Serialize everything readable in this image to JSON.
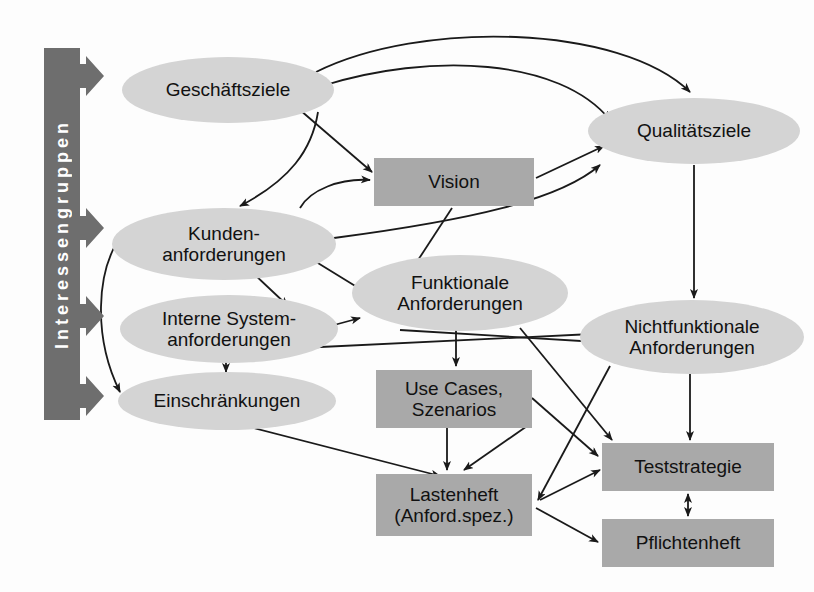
{
  "diagram": {
    "stakeholder_bar": {
      "label": "Interessengruppen",
      "color": "#6e6e6e",
      "arrow_count": 4
    },
    "colors": {
      "ellipse_fill": "#d4d4d4",
      "rect_fill": "#a9a9a9",
      "bar_fill": "#6e6e6e",
      "edge_stroke": "#1a1a1a",
      "text": "#111111",
      "background": "#fdfdfd"
    },
    "nodes": [
      {
        "id": "geschaeftsziele",
        "shape": "ellipse",
        "lines": [
          "Geschäftsziele"
        ],
        "x": 122,
        "y": 57,
        "w": 212,
        "h": 66
      },
      {
        "id": "qualitaetsziele",
        "shape": "ellipse",
        "lines": [
          "Qualitätsziele"
        ],
        "x": 588,
        "y": 98,
        "w": 212,
        "h": 66
      },
      {
        "id": "vision",
        "shape": "rect",
        "lines": [
          "Vision"
        ],
        "x": 374,
        "y": 158,
        "w": 160,
        "h": 48
      },
      {
        "id": "kundenanforderungen",
        "shape": "ellipse",
        "lines": [
          "Kunden-",
          "anforderungen"
        ],
        "x": 112,
        "y": 208,
        "w": 224,
        "h": 72
      },
      {
        "id": "funktionale",
        "shape": "ellipse",
        "lines": [
          "Funktionale",
          "Anforderungen"
        ],
        "x": 352,
        "y": 255,
        "w": 216,
        "h": 76
      },
      {
        "id": "interne_system",
        "shape": "ellipse",
        "lines": [
          "Interne System-",
          "anforderungen"
        ],
        "x": 120,
        "y": 295,
        "w": 218,
        "h": 68
      },
      {
        "id": "nichtfunktionale",
        "shape": "ellipse",
        "lines": [
          "Nichtfunktionale",
          "Anforderungen"
        ],
        "x": 580,
        "y": 300,
        "w": 224,
        "h": 74
      },
      {
        "id": "einschraenkungen",
        "shape": "ellipse",
        "lines": [
          "Einschränkungen"
        ],
        "x": 118,
        "y": 372,
        "w": 218,
        "h": 58
      },
      {
        "id": "use_cases",
        "shape": "rect",
        "lines": [
          "Use Cases,",
          "Szenarios"
        ],
        "x": 376,
        "y": 370,
        "w": 156,
        "h": 58
      },
      {
        "id": "lastenheft",
        "shape": "rect",
        "lines": [
          "Lastenheft",
          "(Anford.spez.)"
        ],
        "x": 376,
        "y": 474,
        "w": 156,
        "h": 62
      },
      {
        "id": "teststrategie",
        "shape": "rect",
        "lines": [
          "Teststrategie"
        ],
        "x": 602,
        "y": 443,
        "w": 172,
        "h": 48
      },
      {
        "id": "pflichtenheft",
        "shape": "rect",
        "lines": [
          "Pflichtenheft"
        ],
        "x": 602,
        "y": 519,
        "w": 172,
        "h": 48
      }
    ],
    "edges": [
      {
        "from": "geschaeftsziele",
        "to": "qualitaetsziele",
        "style": "curved"
      },
      {
        "from": "geschaeftsziele",
        "to": "vision",
        "style": "straight"
      },
      {
        "from": "geschaeftsziele",
        "to": "nichtfunktionale",
        "style": "curved"
      },
      {
        "from": "kundenanforderungen",
        "to": "vision",
        "style": "curved"
      },
      {
        "from": "kundenanforderungen",
        "to": "qualitaetsziele",
        "style": "curved"
      },
      {
        "from": "kundenanforderungen",
        "to": "funktionale",
        "style": "straight"
      },
      {
        "from": "kundenanforderungen",
        "to": "interne_system",
        "style": "straight"
      },
      {
        "from": "kundenanforderungen",
        "to": "einschraenkungen",
        "style": "curved"
      },
      {
        "from": "vision",
        "to": "funktionale",
        "style": "straight"
      },
      {
        "from": "vision",
        "to": "qualitaetsziele",
        "style": "straight"
      },
      {
        "from": "interne_system",
        "to": "funktionale",
        "style": "straight"
      },
      {
        "from": "interne_system",
        "to": "nichtfunktionale",
        "style": "straight"
      },
      {
        "from": "interne_system",
        "to": "einschraenkungen",
        "style": "straight"
      },
      {
        "from": "funktionale",
        "to": "use_cases",
        "style": "straight"
      },
      {
        "from": "funktionale",
        "to": "teststrategie",
        "style": "straight"
      },
      {
        "from": "funktionale",
        "to": "nichtfunktionale",
        "style": "straight"
      },
      {
        "from": "nichtfunktionale",
        "to": "teststrategie",
        "style": "straight"
      },
      {
        "from": "nichtfunktionale",
        "to": "lastenheft",
        "style": "straight"
      },
      {
        "from": "qualitaetsziele",
        "to": "nichtfunktionale",
        "style": "straight"
      },
      {
        "from": "use_cases",
        "to": "lastenheft",
        "style": "straight"
      },
      {
        "from": "use_cases",
        "to": "teststrategie",
        "style": "straight"
      },
      {
        "from": "einschraenkungen",
        "to": "lastenheft",
        "style": "straight"
      },
      {
        "from": "lastenheft",
        "to": "teststrategie",
        "style": "straight"
      },
      {
        "from": "lastenheft",
        "to": "pflichtenheft",
        "style": "straight"
      },
      {
        "from": "teststrategie",
        "to": "pflichtenheft",
        "style": "double"
      }
    ]
  }
}
